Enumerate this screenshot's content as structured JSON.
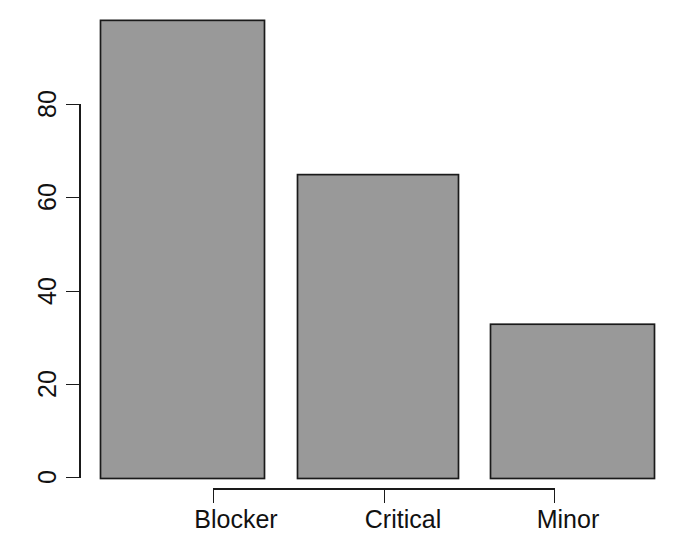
{
  "chart_data": {
    "type": "bar",
    "title": "",
    "subtitle": "",
    "xlabel": "",
    "ylabel": "",
    "categories": [
      "Blocker",
      "Critical",
      "Minor"
    ],
    "values": [
      98,
      65,
      33
    ],
    "ylim": [
      0,
      98
    ],
    "yticks": [
      0,
      20,
      40,
      60,
      80
    ],
    "ytick_labels": [
      "0",
      "20",
      "40",
      "60",
      "80"
    ],
    "xtick_labels": [
      "Blocker",
      "Critical",
      "Minor"
    ],
    "grid": false,
    "legend": null,
    "legend_position": "none",
    "annotations": [],
    "bar_fill_color": "#999999",
    "bar_border_color": "#1a1a1a",
    "axis_color": "#1a1a1a",
    "background_color": "#ffffff",
    "ytick_label_rotation": 90
  }
}
